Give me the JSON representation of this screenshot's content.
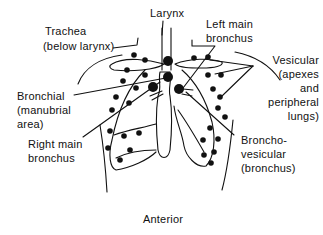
{
  "diagram": {
    "view": "Anterior",
    "labels": {
      "larynx": "Larynx",
      "trachea_line1": "Trachea",
      "trachea_line2": "(below larynx)",
      "left_main_line1": "Left main",
      "left_main_line2": "bronchus",
      "vesicular_line1": "Vesicular",
      "vesicular_line2": "(apexes",
      "vesicular_line3": "and",
      "vesicular_line4": "peripheral",
      "vesicular_line5": "lungs)",
      "bronchial_line1": "Bronchial",
      "bronchial_line2": "(manubrial",
      "bronchial_line3": "area)",
      "right_main_line1": "Right main",
      "right_main_line2": "bronchus",
      "bronchovesicular_line1": "Broncho-",
      "bronchovesicular_line2": "vesicular",
      "bronchovesicular_line3": "(bronchus)"
    },
    "colors": {
      "ink": "#111111",
      "background": "#ffffff"
    }
  }
}
